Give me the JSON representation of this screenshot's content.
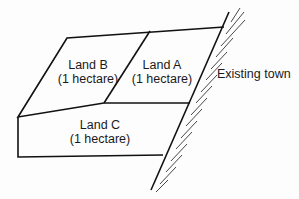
{
  "diagram": {
    "type": "land-parcel-map",
    "parcels": [
      {
        "id": "B",
        "name": "Land B",
        "area": "(1 hectare)"
      },
      {
        "id": "A",
        "name": "Land A",
        "area": "(1 hectare)"
      },
      {
        "id": "C",
        "name": "Land C",
        "area": "(1 hectare)"
      }
    ],
    "boundary_label": "Existing town",
    "colors": {
      "line": "#111111",
      "background": "#fdfdfd",
      "text": "#1a1a1a"
    }
  }
}
